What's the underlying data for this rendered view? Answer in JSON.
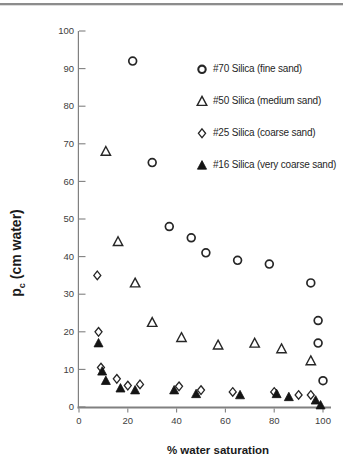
{
  "chart_data": {
    "type": "scatter",
    "title": "",
    "xlabel": "% water saturation",
    "ylabel": {
      "main": "p",
      "sub": "c",
      "rest": " (cm water)"
    },
    "xlim": [
      0,
      100
    ],
    "ylim": [
      0,
      100
    ],
    "x_ticks": [
      0,
      20,
      40,
      60,
      80,
      100
    ],
    "y_ticks": [
      0,
      10,
      20,
      30,
      40,
      50,
      60,
      70,
      80,
      90,
      100
    ],
    "grid": false,
    "legend_position": "upper-right-inside",
    "series": [
      {
        "name": "#70 Silica  (fine sand)",
        "marker": "circle-open",
        "points": [
          [
            22,
            92
          ],
          [
            30,
            65
          ],
          [
            37,
            48
          ],
          [
            46,
            45
          ],
          [
            52,
            41
          ],
          [
            65,
            39
          ],
          [
            78,
            38
          ],
          [
            95,
            33
          ],
          [
            98,
            23
          ],
          [
            98,
            17
          ],
          [
            100,
            7
          ]
        ]
      },
      {
        "name": "#50 Silica  (medium sand)",
        "marker": "triangle-open",
        "points": [
          [
            11,
            68
          ],
          [
            16,
            44
          ],
          [
            23,
            33
          ],
          [
            30,
            22.5
          ],
          [
            42,
            18.5
          ],
          [
            57,
            16.5
          ],
          [
            72,
            17
          ],
          [
            83,
            15.5
          ],
          [
            95,
            12.3
          ]
        ]
      },
      {
        "name": "#25 Silica  (coarse sand)",
        "marker": "diamond-open",
        "points": [
          [
            7.5,
            35
          ],
          [
            8,
            20
          ],
          [
            9,
            10.5
          ],
          [
            15.5,
            7.5
          ],
          [
            20,
            5.7
          ],
          [
            25,
            6
          ],
          [
            41,
            5.5
          ],
          [
            50,
            4.5
          ],
          [
            63,
            4
          ],
          [
            80,
            4
          ],
          [
            90,
            3.2
          ],
          [
            95,
            3.2
          ]
        ]
      },
      {
        "name": "#16 Silica  (very coarse sand)",
        "marker": "triangle-filled",
        "points": [
          [
            8,
            17
          ],
          [
            9.5,
            9.5
          ],
          [
            11,
            7
          ],
          [
            17,
            5
          ],
          [
            23,
            4.5
          ],
          [
            39,
            4.5
          ],
          [
            48,
            3.5
          ],
          [
            66,
            3.2
          ],
          [
            81,
            3.5
          ],
          [
            86,
            2.7
          ],
          [
            97,
            1.8
          ],
          [
            99,
            0.5
          ]
        ]
      }
    ]
  },
  "colors": {
    "marker_stroke": "#262626",
    "marker_fill_open": "#ffffff",
    "marker_fill_solid": "#141414",
    "axis_line": "#808080",
    "tick_text": "#404040",
    "title_text": "#1a1a1a"
  }
}
